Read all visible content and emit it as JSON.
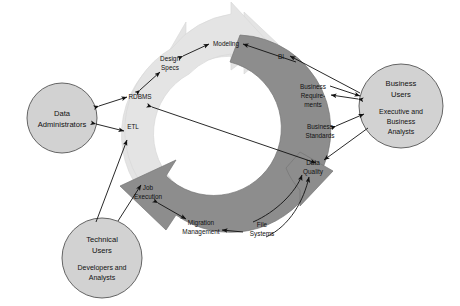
{
  "diagram": {
    "colors": {
      "background": "#ffffff",
      "light_arc": "#e4e4e4",
      "light_arc_stroke": "#d0d0d0",
      "dark_arc": "#8d8d8d",
      "dark_arc_stroke": "#6f6f6f",
      "node_fill": "#d2d2d2",
      "node_stroke": "#555555",
      "connector": "#111111",
      "text": "#111111"
    },
    "nodes": [
      {
        "id": "data-administrators",
        "title": "Data",
        "subtitle": "Administrators",
        "cx": 62,
        "cy": 118,
        "r": 35
      },
      {
        "id": "business-users",
        "title_line1": "Business",
        "title_line2": "Users",
        "sub_line1": "Executive and",
        "sub_line2": "Business",
        "sub_line3": "Analysts",
        "cx": 401,
        "cy": 106,
        "r": 42
      },
      {
        "id": "technical-users",
        "title_line1": "Technical",
        "title_line2": "Users",
        "sub_line1": "Developers and",
        "sub_line2": "Analysts",
        "cx": 102,
        "cy": 258,
        "r": 40
      }
    ],
    "light_arc_labels": [
      {
        "id": "modeling",
        "text": "Modeling",
        "x": 226,
        "y": 44
      },
      {
        "id": "design-specs",
        "line1": "Design",
        "line2": "Specs",
        "x": 170,
        "y": 63
      },
      {
        "id": "rdbms",
        "text": "RDBMS",
        "x": 140,
        "y": 97
      },
      {
        "id": "etl",
        "text": "ETL",
        "x": 133,
        "y": 127
      }
    ],
    "dark_arc_labels": [
      {
        "id": "bi",
        "text": "BI",
        "x": 281,
        "y": 57
      },
      {
        "id": "business-requirements",
        "line1": "Business",
        "line2": "Require-",
        "line3": "ments",
        "x": 313,
        "y": 94
      },
      {
        "id": "business-standards",
        "line1": "Business",
        "line2": "Standards",
        "x": 320,
        "y": 131
      },
      {
        "id": "data-quality",
        "line1": "Data",
        "line2": "Quality",
        "x": 313,
        "y": 167
      },
      {
        "id": "file-systems",
        "line1": "File",
        "line2": "Systems",
        "x": 262,
        "y": 229
      },
      {
        "id": "migration-management",
        "line1": "Migration",
        "line2": "Management",
        "x": 201,
        "y": 227
      },
      {
        "id": "job-execution",
        "line1": "Job",
        "line2": "Execution",
        "x": 148,
        "y": 192
      }
    ]
  }
}
